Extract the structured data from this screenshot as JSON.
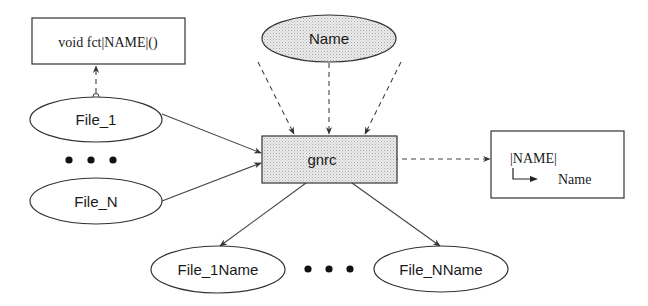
{
  "diagram": {
    "colors": {
      "stroke": "#333333",
      "fill_shaded": "#e4e4e4",
      "fill_plain": "#ffffff",
      "text": "#1a1a1a"
    },
    "nodes": {
      "function_box": {
        "label": "void fct|NAME|()",
        "shape": "rectangle"
      },
      "name": {
        "label": "Name",
        "shape": "ellipse",
        "shaded": true
      },
      "file_1": {
        "label": "File_1",
        "shape": "ellipse"
      },
      "file_n": {
        "label": "File_N",
        "shape": "ellipse"
      },
      "gnrc": {
        "label": "gnrc",
        "shape": "rectangle",
        "shaded": true
      },
      "substitution_box": {
        "placeholder": "|NAME|",
        "replacement": "Name",
        "shape": "rectangle",
        "icon": "arrow-turn-right-icon"
      },
      "file_1name": {
        "label": "File_1Name",
        "shape": "ellipse"
      },
      "file_nname": {
        "label": "File_NName",
        "shape": "ellipse"
      }
    },
    "ellipsis": {
      "left": "• • •",
      "bottom": "• • •"
    },
    "edges": [
      {
        "from": "file_1",
        "to": "function_box",
        "style": "dashed",
        "start": "circle"
      },
      {
        "from": "name",
        "to": "gnrc",
        "style": "dashed",
        "count": 3
      },
      {
        "from": "file_1",
        "to": "gnrc",
        "style": "solid"
      },
      {
        "from": "file_n",
        "to": "gnrc",
        "style": "solid"
      },
      {
        "from": "gnrc",
        "to": "substitution_box",
        "style": "dashed",
        "start": "circle"
      },
      {
        "from": "gnrc",
        "to": "file_1name",
        "style": "solid"
      },
      {
        "from": "gnrc",
        "to": "file_nname",
        "style": "solid"
      }
    ]
  }
}
